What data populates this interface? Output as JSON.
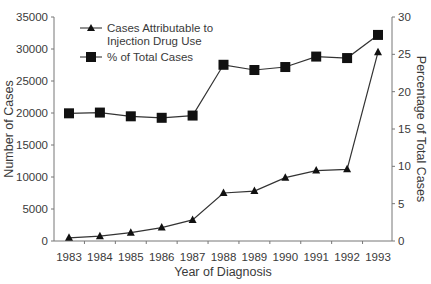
{
  "chart_data": {
    "type": "line",
    "title": "",
    "xlabel": "Year of Diagnosis",
    "ylabel": "Number of Cases",
    "y2label": "Percentage of Total Cases",
    "categories": [
      "1983",
      "1984",
      "1985",
      "1986",
      "1987",
      "1988",
      "1989",
      "1990",
      "1991",
      "1992",
      "1993"
    ],
    "ylim": [
      0,
      35000
    ],
    "y2lim": [
      0,
      30
    ],
    "yticks": [
      "0",
      "5000",
      "10000",
      "15000",
      "20000",
      "25000",
      "30000",
      "35000"
    ],
    "y2ticks": [
      "0",
      "5",
      "10",
      "15",
      "20",
      "25",
      "30"
    ],
    "grid": false,
    "legend_position": "upper left",
    "series": [
      {
        "name": "Cases Attributable to Injection Drug Use",
        "axis": "left",
        "marker": "triangle",
        "values": [
          500,
          750,
          1300,
          2100,
          3300,
          7500,
          7800,
          9900,
          11000,
          11200,
          29500
        ]
      },
      {
        "name": "% of Total Cases",
        "axis": "right",
        "marker": "square",
        "values": [
          17.1,
          17.2,
          16.7,
          16.5,
          16.8,
          23.6,
          22.9,
          23.3,
          24.7,
          24.5,
          27.6
        ]
      }
    ]
  },
  "legend": {
    "series1_line1": "Cases Attributable to",
    "series1_line2": "Injection Drug Use",
    "series2": "% of Total Cases"
  }
}
